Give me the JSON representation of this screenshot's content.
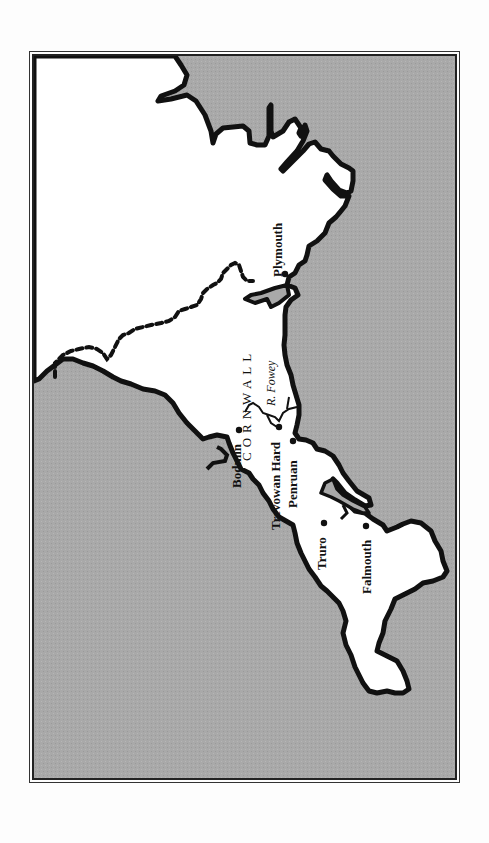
{
  "map": {
    "region_label": "CORNWALL",
    "river_label": "R. Fowey",
    "towns": [
      {
        "name": "Plymouth",
        "x": 282,
        "y": 271
      },
      {
        "name": "Bodmin",
        "x": 236,
        "y": 427
      },
      {
        "name": "Trevowan Hard",
        "x": 276,
        "y": 424
      },
      {
        "name": "Penruan",
        "x": 290,
        "y": 438
      },
      {
        "name": "Truro",
        "x": 321,
        "y": 520
      },
      {
        "name": "Falmouth",
        "x": 363,
        "y": 523
      }
    ],
    "colors": {
      "sea": "#a9a9a9",
      "land": "#ffffff",
      "coastline": "#111111",
      "frame": "#222222"
    },
    "orientation": "rotated 90 degrees counter-clockwise"
  }
}
